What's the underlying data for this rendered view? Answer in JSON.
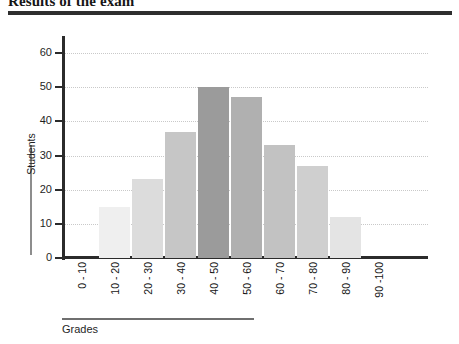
{
  "title": "Results of the exam",
  "axis": {
    "y_title": "Students",
    "x_title": "Grades"
  },
  "chart_data": {
    "type": "bar",
    "title": "Results of the exam",
    "xlabel": "Grades",
    "ylabel": "Students",
    "categories": [
      "0 - 10",
      "10 - 20",
      "20 - 30",
      "30 - 40",
      "40 - 50",
      "50 - 60",
      "60 - 70",
      "70 - 80",
      "80 - 90",
      "90 -100"
    ],
    "values": [
      0,
      15,
      23,
      37,
      50,
      47,
      33,
      27,
      12,
      0
    ],
    "bar_colors": [
      "#ffffff",
      "#efefef",
      "#dcdcdc",
      "#c6c6c6",
      "#9b9b9b",
      "#b0b0b0",
      "#c2c2c2",
      "#cfcfcf",
      "#e4e4e4",
      "#ffffff"
    ],
    "ylim": [
      0,
      65
    ],
    "yticks": [
      0,
      10,
      20,
      30,
      40,
      50,
      60
    ],
    "ytick_labels": [
      "0",
      "10",
      "20",
      "30",
      "40",
      "50",
      "60"
    ],
    "grid": true,
    "grid_axis": "y",
    "legend": false
  }
}
